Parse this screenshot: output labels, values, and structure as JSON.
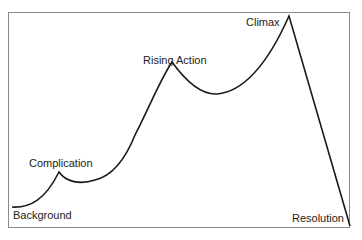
{
  "diagram": {
    "type": "story-arc",
    "labels": {
      "background": "Background",
      "complication": "Complication",
      "rising_action": "Rising Action",
      "climax": "Climax",
      "resolution": "Resolution"
    },
    "colors": {
      "line": "#1a1a1a",
      "frame": "#8a8a8a"
    }
  }
}
